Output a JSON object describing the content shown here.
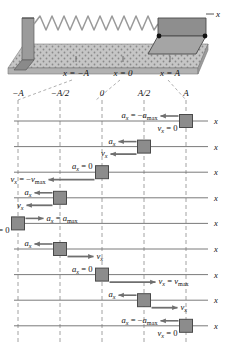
{
  "figure": {
    "title_alt": "Block on spring undergoing simple harmonic motion",
    "axis_label": "x",
    "apparatus": {
      "label_neg_A": "x = −A",
      "label_zero": "x = 0",
      "label_pos_A": "x = A",
      "axis_label": "x",
      "spring_color": "#a9a9a9",
      "block_color": "#8e8e8e",
      "surface_color": "#bdbdbd"
    },
    "scale_ticks": [
      {
        "label": "−A",
        "x_frac": 0.0
      },
      {
        "label": "−A/2",
        "x_frac": 0.25
      },
      {
        "label": "0",
        "x_frac": 0.5
      },
      {
        "label": "A/2",
        "x_frac": 0.75
      },
      {
        "label": "A",
        "x_frac": 1.0
      }
    ],
    "colors": {
      "block_fill": "#8c8c8c",
      "block_stroke": "#4a4a4a",
      "axis_line": "#6b6b6b",
      "dashed_line": "#8a8a8a",
      "arrow": "#6f6f6f",
      "text": "#111111"
    },
    "rows": [
      {
        "index": 1,
        "position": "A",
        "pos_frac": 1.0,
        "accel_label": "a_x = −a_max",
        "accel_label_parts": {
          "sym": "a",
          "sub": "x",
          "eq": "= −",
          "val": "a",
          "valsub": "max"
        },
        "accel_dir": "left",
        "accel_len": "short",
        "accel_zero": false,
        "vel_label": "v_x = 0",
        "vel_label_parts": {
          "sym": "v",
          "sub": "x",
          "eq": "= 0"
        },
        "vel_dir": "none",
        "vel_len": "none",
        "vel_zero": true,
        "axis_label": "x"
      },
      {
        "index": 2,
        "position": "A/2",
        "pos_frac": 0.75,
        "accel_label": "a_x",
        "accel_label_parts": {
          "sym": "a",
          "sub": "x",
          "eq": "",
          "val": "",
          "valsub": ""
        },
        "accel_dir": "left",
        "accel_len": "short",
        "accel_zero": false,
        "vel_label": "v_x",
        "vel_label_parts": {
          "sym": "v",
          "sub": "x",
          "eq": ""
        },
        "vel_dir": "left",
        "vel_len": "medium",
        "vel_zero": false,
        "axis_label": "x"
      },
      {
        "index": 3,
        "position": "0",
        "pos_frac": 0.5,
        "accel_label": "a_x = 0",
        "accel_label_parts": {
          "sym": "a",
          "sub": "x",
          "eq": "= 0",
          "val": "",
          "valsub": ""
        },
        "accel_dir": "none",
        "accel_len": "none",
        "accel_zero": true,
        "vel_label": "v_x = −v_max",
        "vel_label_parts": {
          "sym": "v",
          "sub": "x",
          "eq": "= −",
          "val": "v",
          "valsub": "max"
        },
        "vel_dir": "left",
        "vel_len": "long",
        "vel_zero": false,
        "axis_label": "x"
      },
      {
        "index": 4,
        "position": "−A/2",
        "pos_frac": 0.25,
        "accel_label": "a_x",
        "accel_label_parts": {
          "sym": "a",
          "sub": "x",
          "eq": "",
          "val": "",
          "valsub": ""
        },
        "accel_dir": "left",
        "accel_len": "short",
        "accel_zero": false,
        "vel_label": "v_x",
        "vel_label_parts": {
          "sym": "v",
          "sub": "x",
          "eq": ""
        },
        "vel_dir": "left",
        "vel_len": "medium",
        "vel_zero": false,
        "axis_label": "x"
      },
      {
        "index": 5,
        "position": "−A",
        "pos_frac": 0.0,
        "accel_label": "a_x = a_max",
        "accel_label_parts": {
          "sym": "a",
          "sub": "x",
          "eq": "= ",
          "val": "a",
          "valsub": "max"
        },
        "accel_dir": "right",
        "accel_len": "short",
        "accel_zero": false,
        "vel_label": "v_x = 0",
        "vel_label_parts": {
          "sym": "v",
          "sub": "x",
          "eq": "= 0"
        },
        "vel_dir": "none",
        "vel_len": "none",
        "vel_zero": true,
        "axis_label": "x"
      },
      {
        "index": 6,
        "position": "−A/2",
        "pos_frac": 0.25,
        "accel_label": "a_x",
        "accel_label_parts": {
          "sym": "a",
          "sub": "x",
          "eq": "",
          "val": "",
          "valsub": ""
        },
        "accel_dir": "left",
        "accel_len": "short",
        "accel_zero": false,
        "vel_label": "v_x",
        "vel_label_parts": {
          "sym": "v",
          "sub": "x",
          "eq": ""
        },
        "vel_dir": "right",
        "vel_len": "medium",
        "vel_zero": false,
        "axis_label": "x"
      },
      {
        "index": 7,
        "position": "0",
        "pos_frac": 0.5,
        "accel_label": "a_x = 0",
        "accel_label_parts": {
          "sym": "a",
          "sub": "x",
          "eq": "= 0",
          "val": "",
          "valsub": ""
        },
        "accel_dir": "none",
        "accel_len": "none",
        "accel_zero": true,
        "vel_label": "v_x = v_max",
        "vel_label_parts": {
          "sym": "v",
          "sub": "x",
          "eq": "= ",
          "val": "v",
          "valsub": "max"
        },
        "vel_dir": "right",
        "vel_len": "long",
        "vel_zero": false,
        "axis_label": "x"
      },
      {
        "index": 8,
        "position": "A/2",
        "pos_frac": 0.75,
        "accel_label": "a_x",
        "accel_label_parts": {
          "sym": "a",
          "sub": "x",
          "eq": "",
          "val": "",
          "valsub": ""
        },
        "accel_dir": "left",
        "accel_len": "short",
        "accel_zero": false,
        "vel_label": "v_x",
        "vel_label_parts": {
          "sym": "v",
          "sub": "x",
          "eq": ""
        },
        "vel_dir": "right",
        "vel_len": "medium",
        "vel_zero": false,
        "axis_label": "x"
      },
      {
        "index": 9,
        "position": "A",
        "pos_frac": 1.0,
        "accel_label": "a_x = −a_max",
        "accel_label_parts": {
          "sym": "a",
          "sub": "x",
          "eq": "= −",
          "val": "a",
          "valsub": "max"
        },
        "accel_dir": "left",
        "accel_len": "short",
        "accel_zero": false,
        "vel_label": "v_x = 0",
        "vel_label_parts": {
          "sym": "v",
          "sub": "x",
          "eq": "= 0"
        },
        "vel_dir": "none",
        "vel_len": "none",
        "vel_zero": true,
        "axis_label": "x"
      }
    ]
  }
}
